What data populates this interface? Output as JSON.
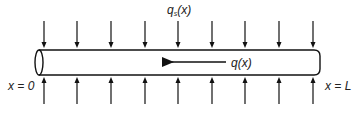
{
  "diagram": {
    "labels": {
      "surface_load": {
        "main": "q",
        "sub": "s",
        "arg": "(x)"
      },
      "internal_flow": "q(x)",
      "left_end": "x = 0",
      "right_end": "x = L"
    },
    "colors": {
      "stroke": "#111111",
      "text": "#222222",
      "background": "#ffffff"
    },
    "tube": {
      "x_start": 39,
      "x_end": 320,
      "y_top": 50,
      "y_bottom": 75
    },
    "load_arrows": {
      "x_positions": [
        44,
        77,
        111,
        145,
        178,
        212,
        245,
        279,
        313
      ],
      "top_arrows": {
        "direction": "down",
        "y_start": 21,
        "y_end": 48
      },
      "bottom_arrows": {
        "direction": "up",
        "y_start": 104,
        "y_end": 77
      }
    },
    "flow_arrow": {
      "direction": "left",
      "x_tail": 226,
      "x_head": 160,
      "y": 62
    }
  }
}
